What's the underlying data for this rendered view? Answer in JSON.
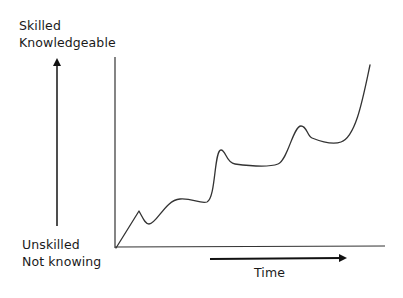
{
  "diagram": {
    "y_axis_top_label": [
      "Skilled",
      "Knowledgeable"
    ],
    "y_axis_bottom_label": [
      "Unskilled",
      "Not knowing"
    ],
    "x_axis_label": "Time",
    "curve_description": "Stepwise learning curve rising over time with plateaus and small dips after each jump",
    "curve_points": [
      [
        116,
        248
      ],
      [
        139,
        211
      ],
      [
        149,
        224
      ],
      [
        178,
        199
      ],
      [
        207,
        202
      ],
      [
        221,
        150
      ],
      [
        235,
        165
      ],
      [
        278,
        165
      ],
      [
        301,
        126
      ],
      [
        312,
        139
      ],
      [
        341,
        142
      ],
      [
        370,
        65
      ]
    ],
    "colors": {
      "line": "#333333",
      "background": "#ffffff"
    }
  }
}
